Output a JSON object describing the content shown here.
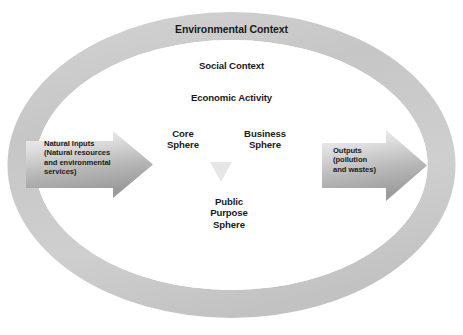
{
  "diagram": {
    "title": "Environmental Context",
    "type": "nested-context-model",
    "contexts": [
      {
        "id": "environmental",
        "label": "Environmental Context"
      },
      {
        "id": "social",
        "label": "Social Context"
      },
      {
        "id": "economic",
        "label": "Economic Activity"
      }
    ],
    "spheres": [
      {
        "id": "core",
        "label": "Core\nSphere"
      },
      {
        "id": "business",
        "label": "Business\nSphere"
      },
      {
        "id": "public-purpose",
        "label": "Public\nPurpose\nSphere"
      }
    ],
    "flows": [
      {
        "id": "inputs",
        "direction": "right",
        "label": "Natural Inputs\n(Natural resources\nand environmental\nservices)"
      },
      {
        "id": "outputs",
        "direction": "right",
        "label": "Outputs\n(pollution\nand wastes)"
      }
    ],
    "colors": {
      "ring": "#c9c9c9",
      "ring_highlight": "#e2e2e2",
      "interior": "#ffffff",
      "arrow_light": "#eaeaea",
      "arrow_dark": "#9e9e9e",
      "marker": "#e4e4e4",
      "text": "#1a1a1a",
      "background": "#ffffff"
    }
  }
}
